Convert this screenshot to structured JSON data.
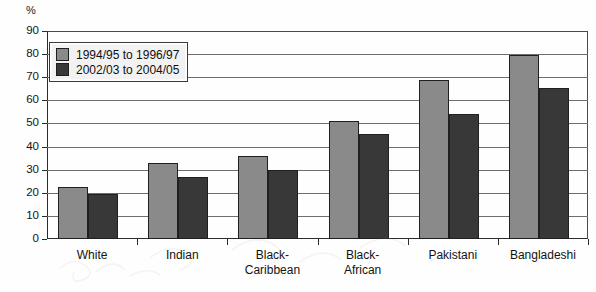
{
  "chart_data": {
    "type": "bar",
    "title": "",
    "subtitle": "",
    "xlabel": "",
    "ylabel": "%",
    "ylim": [
      0,
      90
    ],
    "ytick_step": 10,
    "yticks": [
      0,
      10,
      20,
      30,
      40,
      50,
      60,
      70,
      80,
      90
    ],
    "grid": true,
    "legend_position": "top-left-inside",
    "categories": [
      "White",
      "Indian",
      "Black-\nCaribbean",
      "Black-\nAfrican",
      "Pakistani",
      "Bangladeshi"
    ],
    "series": [
      {
        "name": "1994/95 to 1996/97",
        "color": "#8a8a8a",
        "values": [
          22.5,
          33,
          36,
          51,
          69,
          79.5
        ]
      },
      {
        "name": "2002/03 to 2004/05",
        "color": "#383838",
        "values": [
          19.5,
          27,
          30,
          45.5,
          54,
          65.5
        ]
      }
    ]
  },
  "axis": {
    "unit_label": "%"
  },
  "legend": {
    "items": [
      {
        "label": "1994/95 to 1996/97",
        "color": "#8a8a8a"
      },
      {
        "label": "2002/03 to 2004/05",
        "color": "#383838"
      }
    ]
  },
  "colors": {
    "series_light": "#8a8a8a",
    "series_dark": "#383838",
    "axis": "#2b2b2b",
    "grid": "#6e6e6e",
    "background": "#fefefe",
    "text": "#121212"
  }
}
